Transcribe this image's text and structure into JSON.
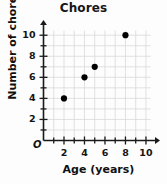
{
  "chart_data": {
    "type": "scatter",
    "title": "Chores",
    "xlabel": "Age (years)",
    "ylabel": "Number of chores",
    "origin_label": "O",
    "xlim": [
      0,
      10.6
    ],
    "ylim": [
      0,
      10.8
    ],
    "grid": true,
    "legend": "none",
    "x_major_ticks": [
      2,
      4,
      6,
      8,
      10
    ],
    "x_minor_ticks": [
      1,
      3,
      5,
      7,
      9
    ],
    "x_tick_labels": [
      "2",
      "4",
      "6",
      "8",
      "10"
    ],
    "y_major_ticks": [
      2,
      4,
      6,
      8,
      10
    ],
    "y_minor_ticks": [
      1,
      3,
      5,
      7,
      9
    ],
    "y_tick_labels": [
      "2",
      "4",
      "6",
      "8",
      "10"
    ],
    "points": [
      {
        "x": 2,
        "y": 4
      },
      {
        "x": 4,
        "y": 6
      },
      {
        "x": 5,
        "y": 7
      },
      {
        "x": 8,
        "y": 10
      }
    ],
    "marker_color": "#000000",
    "grid_color": "#d9d9d9",
    "axis_color": "#1a1a1a",
    "background_color": "#fdfdfd"
  }
}
